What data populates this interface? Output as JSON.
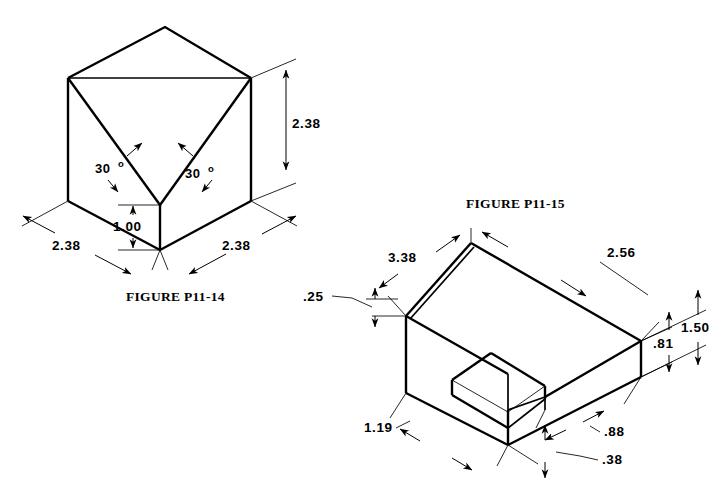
{
  "page": {
    "background_color": "#ffffff",
    "line_color": "#000000",
    "width": 726,
    "height": 501
  },
  "figures": [
    {
      "id": "figure-p11-14",
      "caption": "FIGURE P11-14",
      "description": "Isometric cube with V-groove notch cut into top face",
      "dimensions": [
        {
          "name": "height-right",
          "label": "2.38"
        },
        {
          "name": "width-left-base",
          "label": "2.38"
        },
        {
          "name": "width-right-base",
          "label": "2.38"
        },
        {
          "name": "notch-depth",
          "label": "1.00"
        },
        {
          "name": "angle-left",
          "label": "30",
          "symbol": "o"
        },
        {
          "name": "angle-right",
          "label": "30",
          "symbol": "o"
        }
      ]
    },
    {
      "id": "figure-p11-15",
      "caption": "FIGURE P11-15",
      "description": "Isometric rectangular block with stepped rim and rectangular pocket",
      "dimensions": [
        {
          "name": "top-length-left",
          "label": "3.38"
        },
        {
          "name": "top-length-right",
          "label": "2.56"
        },
        {
          "name": "rim-thickness",
          "label": ".25"
        },
        {
          "name": "overall-height",
          "label": "1.50"
        },
        {
          "name": "body-height",
          "label": ".81"
        },
        {
          "name": "pocket-offset-left",
          "label": "1.19"
        },
        {
          "name": "pocket-offset-right",
          "label": ".88"
        },
        {
          "name": "base-thickness",
          "label": ".38"
        }
      ]
    }
  ],
  "captions": {
    "left": "FIGURE P11-14",
    "right": "FIGURE P11-15"
  },
  "labels": {
    "f14_h_238": "2.38",
    "f14_wl_238": "2.38",
    "f14_wr_238": "2.38",
    "f14_notch_100": "1.00",
    "f14_ang_l": "30",
    "f14_ang_r": "30",
    "f14_deg_l": "o",
    "f14_deg_r": "o",
    "f15_338": "3.38",
    "f15_256": "2.56",
    "f15_25": ".25",
    "f15_150": "1.50",
    "f15_81": ".81",
    "f15_119": "1.19",
    "f15_88": ".88",
    "f15_38": ".38"
  }
}
